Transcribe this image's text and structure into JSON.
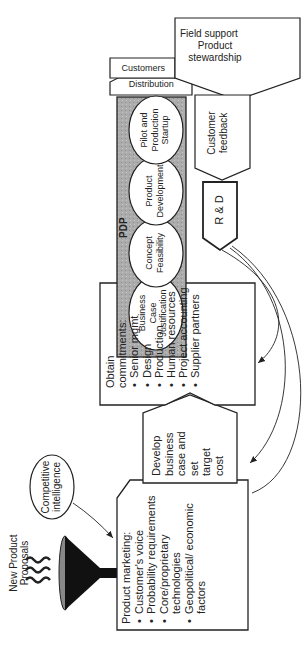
{
  "diagram": {
    "funnel": {
      "label_line1": "New Product",
      "label_line2": "Proposals",
      "icon": "funnel-icon"
    },
    "competitive_intelligence": {
      "line1": "Competitive",
      "line2": "intelligence"
    },
    "product_marketing": {
      "title": "Product marketing:",
      "items": [
        "Customer's voice",
        "Probability requirements",
        "Core/proprietary technologies",
        "Geopolitical/ economic factors"
      ]
    },
    "develop": {
      "line1": "Develop",
      "line2": "business",
      "line3": "case and",
      "line4": "set",
      "line5": "target",
      "line6": "cost"
    },
    "obtain_commitments": {
      "title": "Obtain commitments:",
      "items": [
        "Senior mgmt",
        "Design",
        "Production",
        "Human resources",
        "Project accounting",
        "Supplier partners"
      ]
    },
    "pdp": {
      "label": "PDP",
      "stages": [
        {
          "line1": "Business",
          "line2": "Case",
          "line3": "Justification"
        },
        {
          "line1": "Concept",
          "line2": "Feasibility"
        },
        {
          "line1": "Product",
          "line2": "Development"
        },
        {
          "line1": "Pilot and",
          "line2": "Production",
          "line3": "Startup"
        }
      ]
    },
    "distribution": {
      "label": "Distribution"
    },
    "customers": {
      "label": "Customers"
    },
    "field_support": {
      "line1": "Field support",
      "line2": "Product",
      "line3": "stewardship"
    },
    "customer_feedback": {
      "line1": "Customer",
      "line2": "feedback"
    },
    "rd": {
      "label": "R & D"
    },
    "colors": {
      "pdp_fill": "#a9a9a9",
      "stroke": "#222222",
      "background": "#ffffff"
    }
  }
}
